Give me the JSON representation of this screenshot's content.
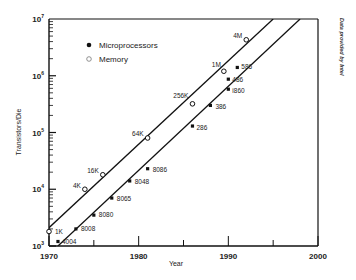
{
  "chart_data": {
    "type": "scatter",
    "title": "",
    "xlabel": "Year",
    "ylabel": "Transistors/Die",
    "xlim": [
      1970,
      2000
    ],
    "ylim": [
      1000,
      10000000
    ],
    "yscale": "log",
    "x_ticks": [
      1970,
      1980,
      1990,
      2000
    ],
    "y_ticks": [
      "10^3",
      "10^4",
      "10^5",
      "10^6",
      "10^7"
    ],
    "grid": false,
    "legend_position": "upper-left",
    "annotation": "Data provided by Intel",
    "series": [
      {
        "name": "Microprocessors",
        "marker": "filled-square",
        "points": [
          {
            "label": "4004",
            "x": 1971,
            "y": 1200
          },
          {
            "label": "8008",
            "x": 1973,
            "y": 2000
          },
          {
            "label": "8080",
            "x": 1975,
            "y": 3500
          },
          {
            "label": "8065",
            "x": 1977,
            "y": 7000
          },
          {
            "label": "8048",
            "x": 1979,
            "y": 14000
          },
          {
            "label": "8086",
            "x": 1981,
            "y": 23000
          },
          {
            "label": "286",
            "x": 1986,
            "y": 130000
          },
          {
            "label": "386",
            "x": 1988,
            "y": 300000
          },
          {
            "label": "i860",
            "x": 1990,
            "y": 580000
          },
          {
            "label": "486",
            "x": 1990,
            "y": 870000
          },
          {
            "label": "586",
            "x": 1991,
            "y": 1400000
          }
        ],
        "trend_line": {
          "x": [
            1971,
            1998
          ],
          "y": [
            1000,
            10000000
          ]
        }
      },
      {
        "name": "Memory",
        "marker": "open-circle",
        "points": [
          {
            "label": "1K",
            "x": 1970,
            "y": 1800
          },
          {
            "label": "4K",
            "x": 1974,
            "y": 10000
          },
          {
            "label": "16K",
            "x": 1976,
            "y": 18000
          },
          {
            "label": "64K",
            "x": 1981,
            "y": 80000
          },
          {
            "label": "256K",
            "x": 1986,
            "y": 320000
          },
          {
            "label": "1M",
            "x": 1989.5,
            "y": 1200000
          },
          {
            "label": "4M",
            "x": 1992,
            "y": 4300000
          }
        ],
        "trend_line": {
          "x": [
            1970,
            1995
          ],
          "y": [
            2100,
            10000000
          ]
        }
      }
    ]
  },
  "axes": {
    "x_tick_labels": [
      "1970",
      "1980",
      "1990",
      "2000"
    ],
    "y_tick_labels": [
      {
        "base": "10",
        "exp": "3"
      },
      {
        "base": "10",
        "exp": "4"
      },
      {
        "base": "10",
        "exp": "5"
      },
      {
        "base": "10",
        "exp": "6"
      },
      {
        "base": "10",
        "exp": "7"
      }
    ],
    "xlabel": "Year",
    "ylabel": "Transistors/Die"
  },
  "legend": {
    "items": [
      {
        "label": "Microprocessors",
        "marker": "filled"
      },
      {
        "label": "Memory",
        "marker": "open"
      }
    ]
  },
  "credit": "Data provided by Intel",
  "colors": {
    "ink": "#111111",
    "background": "#ffffff"
  }
}
